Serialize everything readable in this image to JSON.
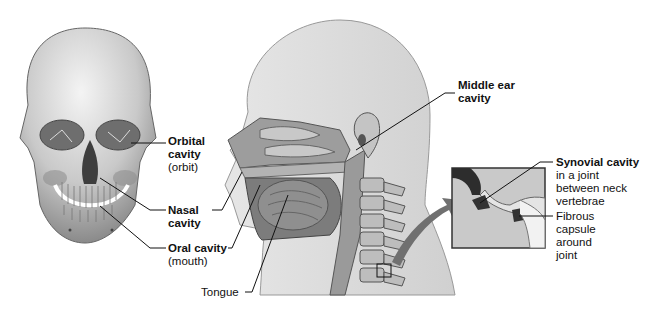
{
  "diagram": {
    "panels": [
      {
        "id": "skull",
        "description": "Anterior view of human skull"
      },
      {
        "id": "head-sagittal",
        "description": "Sagittal section of head and neck"
      },
      {
        "id": "joint-inset",
        "description": "Enlarged view of joint between neck vertebrae"
      }
    ]
  },
  "labels": {
    "orbital": {
      "bold": "Orbital",
      "bold2": "cavity",
      "normal": "(orbit)"
    },
    "nasal": {
      "bold": "Nasal",
      "bold2": "cavity"
    },
    "oral": {
      "bold": "Oral cavity",
      "normal": "(mouth)"
    },
    "tongue": {
      "normal": "Tongue"
    },
    "middle_ear": {
      "bold": "Middle ear",
      "bold2": "cavity"
    },
    "synovial": {
      "bold": "Synovial cavity",
      "line1": "in a joint",
      "line2": "between neck",
      "line3": "vertebrae"
    },
    "fibrous": {
      "line1": "Fibrous",
      "line2": "capsule",
      "line3": "around",
      "line4": "joint"
    }
  },
  "colors": {
    "skin": "#dcdcdc",
    "bone": "#cfcfcf",
    "dark": "#555555",
    "arrow": "#707070",
    "leader": "#111111"
  }
}
